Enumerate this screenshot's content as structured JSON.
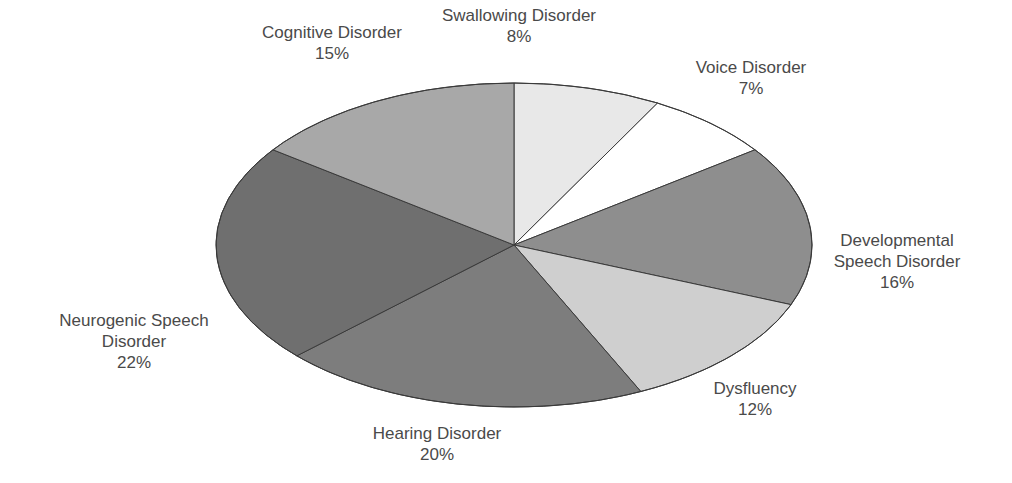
{
  "chart_data": {
    "type": "pie",
    "title": "",
    "start_angle_deg": 0,
    "direction": "clockwise",
    "geometry": {
      "cx": 514,
      "cy": 245,
      "rx": 298,
      "ry": 162
    },
    "slices": [
      {
        "id": "swallowing",
        "label_lines": [
          "Swallowing Disorder"
        ],
        "percent_label": "8%",
        "value": 8,
        "color": "#e8e8e8",
        "label_pos": [
          519,
          5
        ]
      },
      {
        "id": "voice",
        "label_lines": [
          "Voice Disorder"
        ],
        "percent_label": "7%",
        "value": 7,
        "color": "#ffffff",
        "label_pos": [
          751,
          57
        ]
      },
      {
        "id": "developmental",
        "label_lines": [
          "Developmental",
          "Speech Disorder"
        ],
        "percent_label": "16%",
        "value": 16,
        "color": "#8e8e8e",
        "label_pos": [
          897,
          230
        ]
      },
      {
        "id": "dysfluency",
        "label_lines": [
          "Dysfluency"
        ],
        "percent_label": "12%",
        "value": 12,
        "color": "#cfcfcf",
        "label_pos": [
          755,
          378
        ]
      },
      {
        "id": "hearing",
        "label_lines": [
          "Hearing Disorder"
        ],
        "percent_label": "20%",
        "value": 20,
        "color": "#7d7d7d",
        "label_pos": [
          437,
          423
        ]
      },
      {
        "id": "neurogenic",
        "label_lines": [
          "Neurogenic Speech",
          "Disorder"
        ],
        "percent_label": "22%",
        "value": 22,
        "color": "#6f6f6f",
        "label_pos": [
          134,
          310
        ]
      },
      {
        "id": "cognitive",
        "label_lines": [
          "Cognitive Disorder"
        ],
        "percent_label": "15%",
        "value": 15,
        "color": "#a8a8a8",
        "label_pos": [
          332,
          22
        ]
      }
    ],
    "categories": [
      "Swallowing Disorder",
      "Voice Disorder",
      "Developmental Speech Disorder",
      "Dysfluency",
      "Hearing Disorder",
      "Neurogenic Speech Disorder",
      "Cognitive Disorder"
    ],
    "values": [
      8,
      7,
      16,
      12,
      20,
      22,
      15
    ],
    "legend": "none (labels placed outside slices)"
  }
}
